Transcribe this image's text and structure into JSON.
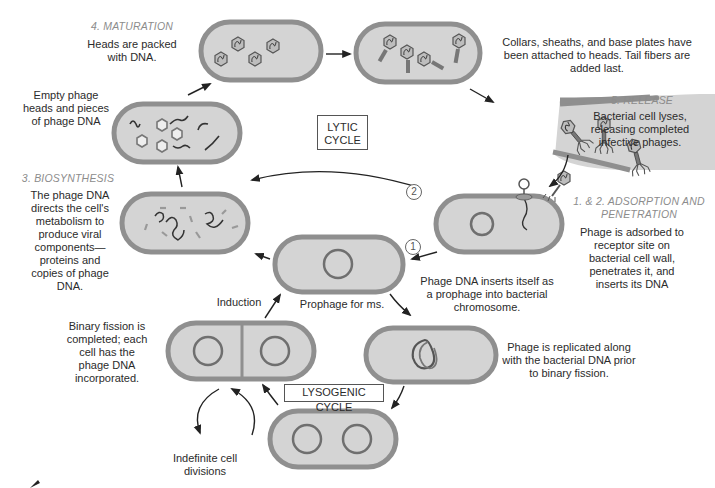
{
  "diagram": {
    "cycle_labels": {
      "lytic": "LYTIC\nCYCLE",
      "lytic_line1": "LYTIC",
      "lytic_line2": "CYCLE",
      "lysogenic": "LYSOGENIC CYCLE"
    },
    "stages": {
      "maturation": {
        "title": "4. MATURATION",
        "text": "Heads are packed with DNA."
      },
      "assembly": {
        "text": "Collars, sheaths, and base plates have been attached to heads.  Tail fibers are added last."
      },
      "release": {
        "title": "5. RELEASE",
        "text": "Bacterial cell lyses, releasing completed infective phages."
      },
      "adsorption": {
        "title": "1. & 2. ADSORPTION AND PENETRATION",
        "text": "Phage is adsorbed to receptor site on bacterial cell wall, penetrates it, and inserts its DNA"
      },
      "biosynthesis": {
        "title": "3. BIOSYNTHESIS",
        "text": "The phage DNA directs the cell's metabolism to produce viral components— proteins and copies of phage DNA."
      },
      "empty_heads": {
        "text": "Empty phage heads and pieces of phage DNA"
      }
    },
    "lysogenic": {
      "insert_text": "Phage DNA inserts itself as a prophage into bacterial chromosome.",
      "prophage_label": "Prophage for ms.",
      "induction_label": "Induction",
      "replicated_text": "Phage is replicated along with the bacterial DNA prior to binary fission.",
      "binary_fission_text": "Binary fission is completed; each cell has the phage DNA incorporated.",
      "indefinite_text": "Indefinite cell divisions"
    },
    "path_markers": {
      "one": "1",
      "two": "2"
    },
    "colors": {
      "cell_wall": "#8f8f8f",
      "cytoplasm": "#d4d4d4",
      "dna": "#3a3a3a",
      "stage_title": "#8c8c8c",
      "text": "#2b2b2b"
    }
  }
}
